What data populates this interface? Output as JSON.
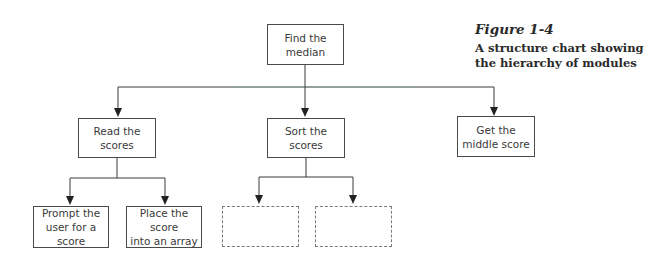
{
  "figure": {
    "label": "Figure 1-4",
    "caption": "A structure chart showing\nthe hierarchy of modules"
  },
  "nodes": {
    "root": "Find the\nmedian",
    "read": "Read the\nscores",
    "sort": "Sort the\nscores",
    "middle": "Get the\nmiddle score",
    "prompt": "Prompt the\nuser for a score",
    "place": "Place the score\ninto an array",
    "sort_child_1": "",
    "sort_child_2": ""
  },
  "colors": {
    "line": "#3a3a3a",
    "root_line_tint": "#7fc7a0",
    "dashed_border": "#7a7a7a"
  }
}
